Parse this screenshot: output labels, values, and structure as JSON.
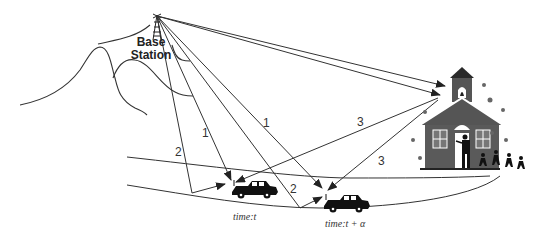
{
  "diagram": {
    "base_station": {
      "label_line1": "Base",
      "label_line2": "Station"
    },
    "path_labels": [
      {
        "id": "p1a",
        "text": "1"
      },
      {
        "id": "p1b",
        "text": "1"
      },
      {
        "id": "p2a",
        "text": "2"
      },
      {
        "id": "p2b",
        "text": "2"
      },
      {
        "id": "p3a",
        "text": "3"
      },
      {
        "id": "p3b",
        "text": "3"
      }
    ],
    "vehicles": [
      {
        "id": "car-t",
        "time_label": "time:t"
      },
      {
        "id": "car-t-alpha",
        "time_label": "time:t + α"
      }
    ],
    "scatterer": "schoolhouse",
    "colors": {
      "line": "#333333",
      "building": "#5a5a5a",
      "roof": "#3a3a3a",
      "car": "#111111"
    }
  }
}
